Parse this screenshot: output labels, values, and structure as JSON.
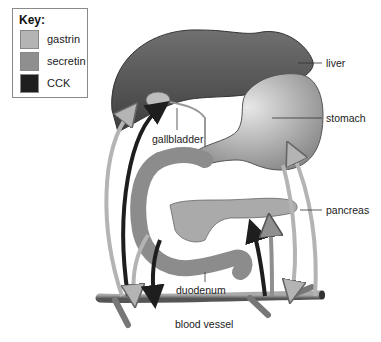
{
  "key": {
    "title": "Key:",
    "items": [
      {
        "label": "gastrin",
        "color": "#b4b4b4"
      },
      {
        "label": "secretin",
        "color": "#8f8f8f"
      },
      {
        "label": "CCK",
        "color": "#1e1e1e"
      }
    ]
  },
  "labels": {
    "liver": "liver",
    "stomach": "stomach",
    "gallbladder": "gallbladder",
    "pancreas": "pancreas",
    "duodenum": "duodenum",
    "blood_vessel": "blood vessel"
  },
  "colors": {
    "liver": "#5a5a5a",
    "organ": "#9a9a9a",
    "gastrin_arrow": "#b4b4b4",
    "secretin_arrow": "#8f8f8f",
    "cck_arrow": "#1e1e1e"
  }
}
